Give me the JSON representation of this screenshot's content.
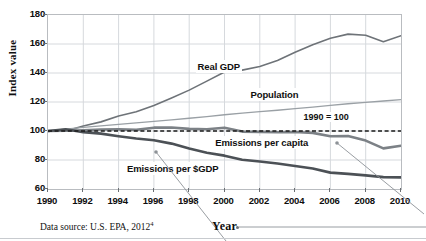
{
  "figure": {
    "source_note_prefix": "Data source: U.S. EPA, 2012",
    "source_note_superscript": "4",
    "year_callout": "Year"
  },
  "chart_data": {
    "type": "line",
    "title": "",
    "xlabel": "Year",
    "ylabel": "Index value",
    "xlim": [
      1990,
      2010
    ],
    "ylim": [
      60,
      180
    ],
    "grid": true,
    "legend_position": "inline-labels",
    "xticks": [
      1990,
      1992,
      1994,
      1996,
      1998,
      2000,
      2002,
      2004,
      2006,
      2008,
      2010
    ],
    "yticks": [
      60,
      80,
      100,
      120,
      140,
      160,
      180
    ],
    "x": [
      1990,
      1991,
      1992,
      1993,
      1994,
      1995,
      1996,
      1997,
      1998,
      1999,
      2000,
      2001,
      2002,
      2003,
      2004,
      2005,
      2006,
      2007,
      2008,
      2009,
      2010
    ],
    "annotations": [
      {
        "text": "1990 = 100",
        "x": 2006,
        "y": 108,
        "kind": "reference-line-label"
      }
    ],
    "reference_line": {
      "y": 100,
      "style": "dashed",
      "color": "#1a1a1a"
    },
    "series": [
      {
        "name": "Real GDP",
        "color": "#6e7378",
        "width": 1.6,
        "label_x": 2000,
        "label_y": 144,
        "values": [
          100,
          99.9,
          103.5,
          106.3,
          110.4,
          113.3,
          117.6,
          122.8,
          128.2,
          134.4,
          140.7,
          142.0,
          144.5,
          148.6,
          154.3,
          159.5,
          163.9,
          166.8,
          166.0,
          161.5,
          165.7
        ]
      },
      {
        "name": "Population",
        "color": "#9aa0a5",
        "width": 1.3,
        "label_x": 2003,
        "label_y": 125,
        "values": [
          100,
          101.3,
          102.5,
          103.6,
          104.6,
          105.6,
          106.6,
          107.7,
          108.8,
          109.9,
          111.2,
          112.3,
          113.3,
          114.3,
          115.4,
          116.5,
          117.7,
          118.8,
          119.8,
          120.7,
          121.6
        ]
      },
      {
        "name": "Emissions per capita",
        "color": "#7c8186",
        "width": 2.6,
        "label_x": 2001,
        "label_y": 92,
        "values": [
          100,
          100.2,
          100.5,
          101.0,
          101.1,
          100.8,
          102.3,
          102.4,
          101.5,
          101.2,
          102.3,
          99.6,
          99.4,
          99.1,
          99.3,
          98.7,
          96.4,
          96.5,
          93.4,
          88.0,
          89.8
        ]
      },
      {
        "name": "Emissions per $GDP",
        "color": "#4c5156",
        "width": 2.6,
        "label_x": 1996,
        "label_y": 74,
        "values": [
          100,
          101.2,
          99.2,
          98.2,
          96.4,
          94.8,
          93.6,
          91.3,
          87.9,
          85.0,
          83.0,
          80.2,
          79.0,
          77.6,
          75.9,
          74.1,
          71.3,
          70.4,
          69.4,
          68.2,
          68.0
        ]
      }
    ]
  }
}
